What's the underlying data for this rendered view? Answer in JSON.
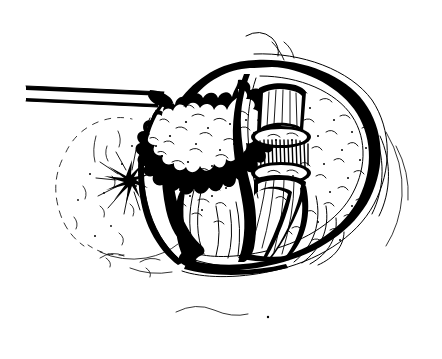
{
  "figure": {
    "medium": "pen-and-ink line art",
    "palette": {
      "ink": "#000000",
      "background": "#ffffff"
    },
    "canvas": {
      "width": 442,
      "height": 359
    },
    "regions": [
      {
        "name": "surgical-instrument",
        "label": "Retractor / probe shaft entering from left margin",
        "description": "Thin double-line straight shaft angled slightly downward from the left edge, tip meeting the capsule rim"
      },
      {
        "name": "outer-capsule",
        "label": "Outer capsule wall",
        "description": "Thick double-contour ovoid boundary enclosing the specimen, heaviest along the upper and right margins"
      },
      {
        "name": "left-lobular-mass",
        "label": "Lobulated left mass",
        "description": "Bumpy scalloped-edge mass filling the left and upper-centre of the cavity, stippled interior texture"
      },
      {
        "name": "midline-septum",
        "label": "Midline dividing boundary",
        "description": "Irregular heavy vertical line separating the lobular mass from the right compartment"
      },
      {
        "name": "transected-tube",
        "label": "Transected tubular structure",
        "description": "Cut cylinder with two open elliptical lumen ends and a densely hatched segment between them"
      },
      {
        "name": "right-compartment",
        "label": "Right compartment",
        "description": "Lightly stippled tissue occupying the right half within the capsule"
      },
      {
        "name": "fibrous-bands",
        "label": "Converging fibrous bands",
        "description": "Long sweeping strands converging toward the lower centre of the cavity"
      },
      {
        "name": "adhesion-starburst",
        "label": "Radiating adhesion point",
        "description": "Dark starburst of radiating short lines on the left capsule margin"
      },
      {
        "name": "background-tissue",
        "label": "Background soft tissue",
        "description": "Faint dotted and broken contours of surrounding tissue behind and below the specimen"
      },
      {
        "name": "wispy-strands",
        "label": "Loose strands",
        "description": "Free-floating wispy curves above the upper capsule and below the lower margin"
      }
    ]
  }
}
